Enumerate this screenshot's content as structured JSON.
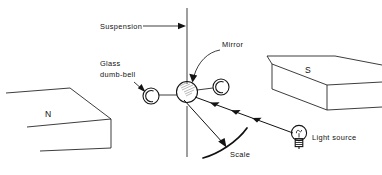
{
  "figure": {
    "background_color": "#ffffff",
    "ink_color": "#141414"
  },
  "labels": {
    "suspension": "Suspension",
    "mirror": "Mirror",
    "glass_dumbbell_line1": "Glass",
    "glass_dumbbell_line2": "dumb-bell",
    "scale": "Scale",
    "light_source": "Light source",
    "north_pole": "N",
    "south_pole": "S"
  },
  "components": {
    "suspension_fibre": "vertical-suspension-fibre",
    "mirror_disc": "mirror-disc",
    "dumbbell_ball_left": "glass-dumbbell-ball-left",
    "dumbbell_ball_right": "glass-dumbbell-ball-right",
    "scale_arc": "curved-scale-arc",
    "lamp": "light-bulb",
    "magnet_north": "north-pole-piece",
    "magnet_south": "south-pole-piece",
    "incident_beam": "incident-light-beam",
    "reflected_beam": "reflected-light-beam"
  }
}
